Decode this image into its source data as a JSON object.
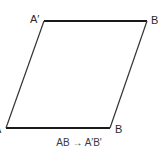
{
  "diagram": {
    "type": "parallelogram-translation",
    "vertices": {
      "A": {
        "label": "A",
        "x": 6,
        "y": 128
      },
      "B": {
        "label": "B",
        "x": 110,
        "y": 128
      },
      "A_prime": {
        "label": "A′",
        "x": 44,
        "y": 21
      },
      "B_prime": {
        "label": "B′",
        "x": 147,
        "y": 21
      }
    },
    "caption": "AB → A′B′",
    "colors": {
      "line": "#1a1a1a",
      "text": "#2a2a2a",
      "background": "#ffffff"
    }
  }
}
